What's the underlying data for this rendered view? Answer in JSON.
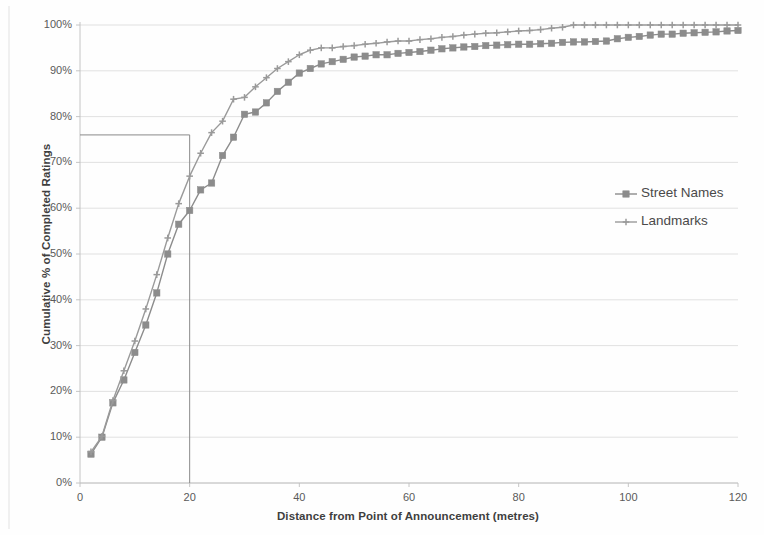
{
  "chart_data": {
    "type": "line",
    "title": "",
    "xlabel": "Distance from Point of Announcement (metres)",
    "ylabel": "Cumulative % of Completed Ratings",
    "xlim": [
      0,
      120
    ],
    "ylim": [
      0,
      100
    ],
    "xticks": [
      0,
      20,
      40,
      60,
      80,
      100,
      120
    ],
    "xtick_labels": [
      "0",
      "20",
      "40",
      "60",
      "80",
      "100",
      "120"
    ],
    "yticks": [
      0,
      10,
      20,
      30,
      40,
      50,
      60,
      70,
      80,
      90,
      100
    ],
    "ytick_labels": [
      "0%",
      "10%",
      "20%",
      "30%",
      "40%",
      "50%",
      "60%",
      "70%",
      "80%",
      "90%",
      "100%"
    ],
    "grid": true,
    "grid_axis": "y",
    "legend_position": "right-middle",
    "series": [
      {
        "name": "Street Names",
        "marker": "square",
        "color": "#8c8c8c",
        "x": [
          2,
          4,
          6,
          8,
          10,
          12,
          14,
          16,
          18,
          20,
          22,
          24,
          26,
          28,
          30,
          32,
          34,
          36,
          38,
          40,
          42,
          44,
          46,
          48,
          50,
          52,
          54,
          56,
          58,
          60,
          62,
          64,
          66,
          68,
          70,
          72,
          74,
          76,
          78,
          80,
          82,
          84,
          86,
          88,
          90,
          92,
          94,
          96,
          98,
          100,
          102,
          104,
          106,
          108,
          110,
          112,
          114,
          116,
          118,
          120
        ],
        "y": [
          6.3,
          10.0,
          17.5,
          22.5,
          28.5,
          34.5,
          41.5,
          50.0,
          56.5,
          59.5,
          64.0,
          65.5,
          71.5,
          75.5,
          80.5,
          81.0,
          83.0,
          85.5,
          87.5,
          89.5,
          90.5,
          91.5,
          92.0,
          92.5,
          93.0,
          93.2,
          93.5,
          93.5,
          93.8,
          94.0,
          94.2,
          94.5,
          94.8,
          95.0,
          95.2,
          95.3,
          95.5,
          95.6,
          95.7,
          95.8,
          95.8,
          95.9,
          96.0,
          96.2,
          96.3,
          96.3,
          96.4,
          96.5,
          97.0,
          97.3,
          97.5,
          97.8,
          98.0,
          98.0,
          98.2,
          98.3,
          98.4,
          98.5,
          98.7,
          98.8
        ]
      },
      {
        "name": "Landmarks",
        "marker": "cross",
        "color": "#9a9a9a",
        "x": [
          2,
          4,
          6,
          8,
          10,
          12,
          14,
          16,
          18,
          20,
          22,
          24,
          26,
          28,
          30,
          32,
          34,
          36,
          38,
          40,
          42,
          44,
          46,
          48,
          50,
          52,
          54,
          56,
          58,
          60,
          62,
          64,
          66,
          68,
          70,
          72,
          74,
          76,
          78,
          80,
          82,
          84,
          86,
          88,
          90,
          92,
          94,
          96,
          98,
          100,
          102,
          104,
          106,
          108,
          110,
          112,
          114,
          116,
          118,
          120
        ],
        "y": [
          6.8,
          10.2,
          18.0,
          24.5,
          31.0,
          38.0,
          45.5,
          53.5,
          61.0,
          67.0,
          72.0,
          76.5,
          79.0,
          83.8,
          84.2,
          86.5,
          88.5,
          90.5,
          92.0,
          93.5,
          94.5,
          95.0,
          95.0,
          95.3,
          95.5,
          95.8,
          96.0,
          96.3,
          96.5,
          96.5,
          96.8,
          97.0,
          97.3,
          97.5,
          97.8,
          98.0,
          98.2,
          98.3,
          98.5,
          98.7,
          98.8,
          99.0,
          99.3,
          99.5,
          100.0,
          100.0,
          100.0,
          100.0,
          100.0,
          100.0,
          100.0,
          100.0,
          100.0,
          100.0,
          100.0,
          100.0,
          100.0,
          100.0,
          100.0,
          100.0
        ]
      }
    ],
    "annotations": [
      {
        "type": "reference-lines",
        "name": "median-crosshair",
        "x_value": 20,
        "y_value": 76.0,
        "description": "Vertical line at 20 metres meeting horizontal line at approximately 76% on the Landmarks curve"
      }
    ],
    "colors": {
      "series_street_names": "#8c8c8c",
      "series_landmarks": "#9a9a9a",
      "gridline": "#d9d9d9",
      "axis": "#bfbfbf",
      "reference_line": "#8a8a8a",
      "text": "#4d4d4d",
      "background": "#fefefe"
    }
  },
  "legend": {
    "items": [
      {
        "label": "Street Names",
        "marker": "square"
      },
      {
        "label": "Landmarks",
        "marker": "cross"
      }
    ]
  }
}
